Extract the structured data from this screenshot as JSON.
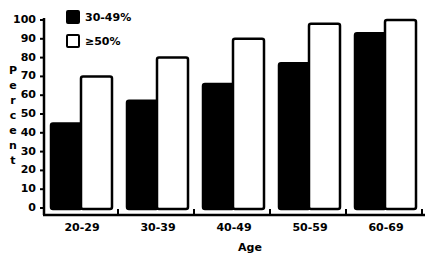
{
  "chart_data": {
    "type": "bar",
    "title": "",
    "xlabel": "Age",
    "ylabel": "Percent",
    "ylim": [
      0,
      100
    ],
    "yticks": [
      0,
      10,
      20,
      30,
      40,
      50,
      60,
      70,
      80,
      90,
      100
    ],
    "categories": [
      "20-29",
      "30-39",
      "40-49",
      "50-59",
      "60-69"
    ],
    "series": [
      {
        "name": "30-49%",
        "color": "#000000",
        "values": [
          45,
          57,
          66,
          77,
          93
        ]
      },
      {
        "name": "≥50%",
        "color": "#ffffff",
        "values": [
          70,
          80,
          90,
          98,
          100
        ]
      }
    ],
    "grid": false,
    "legend_position": "top-left"
  },
  "legend": {
    "item0": "30-49%",
    "item1": "≥50%"
  },
  "axes": {
    "ylabel_chars": [
      "P",
      "e",
      "r",
      "c",
      "e",
      "n",
      "t"
    ],
    "xlabel": "Age"
  }
}
